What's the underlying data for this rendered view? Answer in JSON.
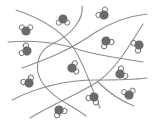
{
  "diagram": {
    "colors": {
      "background": "#ffffff",
      "chain": "#8c8c8c",
      "oxygen": "#6b6b6b",
      "hydrogen_fill": "#ffffff",
      "hydrogen_stroke": "#6b6b6b"
    },
    "chains": [
      "M16,10 C40,18 60,30 72,46 C84,62 92,90 100,108",
      "M82,6 C84,20 70,36 52,44 C36,52 34,70 42,82 C52,98 70,104 86,116",
      "M8,42 C30,40 58,42 80,50 C100,56 120,58 143,62",
      "M22,68 C50,58 70,50 96,32 C112,22 130,16 147,14",
      "M12,100 C40,86 70,80 96,80 C116,80 132,80 147,78",
      "M30,118 C60,100 80,94 100,80 C116,68 128,48 143,24",
      "M98,82 C106,90 118,100 134,106"
    ],
    "molecules": [
      {
        "x": 26,
        "y": 31,
        "rot": 0
      },
      {
        "x": 63,
        "y": 19,
        "rot": 180
      },
      {
        "x": 104,
        "y": 15,
        "rot": -40
      },
      {
        "x": 27,
        "y": 51,
        "rot": -60
      },
      {
        "x": 106,
        "y": 41,
        "rot": 150
      },
      {
        "x": 139,
        "y": 45,
        "rot": -120
      },
      {
        "x": 72,
        "y": 68,
        "rot": 80
      },
      {
        "x": 29,
        "y": 83,
        "rot": -30
      },
      {
        "x": 120,
        "y": 74,
        "rot": 60
      },
      {
        "x": 94,
        "y": 97,
        "rot": -150
      },
      {
        "x": 129,
        "y": 95,
        "rot": -10
      },
      {
        "x": 59,
        "y": 110,
        "rot": 150
      }
    ]
  }
}
